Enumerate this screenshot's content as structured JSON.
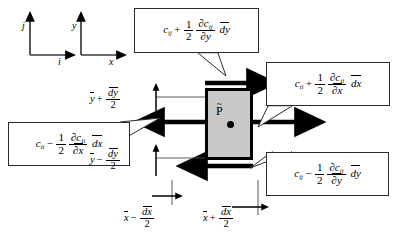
{
  "figure": {
    "type": "control-volume-diagram",
    "background_color": "#ffffff",
    "cell_fill": "#c8c8c8",
    "cell_stroke": "#000000"
  },
  "axes": {
    "unit_vectors": {
      "vertical": "j",
      "horizontal": "i"
    },
    "coordinates": {
      "vertical": "y",
      "horizontal": "x"
    }
  },
  "cell": {
    "point_label": "P",
    "point_accent": "tilde"
  },
  "callouts": {
    "top": {
      "name": "top-face-flux",
      "base": "c",
      "base_sub": "ij",
      "operator": "+",
      "coefficient_num": "1",
      "coefficient_den": "2",
      "partial_num": "∂c",
      "partial_num_sub": "ij",
      "partial_den": "∂y",
      "differential": "dy"
    },
    "right": {
      "name": "right-face-flux",
      "base": "c",
      "base_sub": "ii",
      "operator": "+",
      "coefficient_num": "1",
      "coefficient_den": "2",
      "partial_num": "∂c",
      "partial_num_sub": "ii",
      "partial_den": "∂x",
      "differential": "dx"
    },
    "left": {
      "name": "left-face-flux",
      "base": "c",
      "base_sub": "ii",
      "operator": "−",
      "coefficient_num": "1",
      "coefficient_den": "2",
      "partial_num": "∂c",
      "partial_num_sub": "ii",
      "partial_den": "∂x",
      "differential": "dx"
    },
    "bottom": {
      "name": "bottom-face-flux",
      "base": "c",
      "base_sub": "ij",
      "operator": "−",
      "coefficient_num": "1",
      "coefficient_den": "2",
      "partial_num": "∂c",
      "partial_num_sub": "ij",
      "partial_den": "∂y",
      "differential": "dy"
    }
  },
  "dimensions": {
    "top_left": {
      "name": "y-upper-extent",
      "base": "y",
      "operator": "+",
      "num": "dy",
      "den": "2"
    },
    "bottom_left": {
      "name": "y-lower-extent",
      "base": "y",
      "operator": "−",
      "num": "dy",
      "den": "2"
    },
    "bottom_left_x": {
      "name": "x-left-extent",
      "base": "x",
      "operator": "−",
      "num": "dx",
      "den": "2"
    },
    "bottom_right_x": {
      "name": "x-right-extent",
      "base": "x",
      "operator": "+",
      "num": "dx",
      "den": "2"
    }
  }
}
